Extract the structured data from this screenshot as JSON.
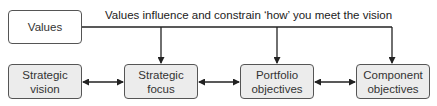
{
  "diagram": {
    "values_box": {
      "label": "Values"
    },
    "caption": "Values influence and constrain ‘how’ you meet the vision",
    "steps": [
      {
        "label": "Strategic vision",
        "line1": "Strategic",
        "line2": "vision"
      },
      {
        "label": "Strategic focus",
        "line1": "Strategic",
        "line2": "focus"
      },
      {
        "label": "Portfolio objectives",
        "line1": "Portfolio",
        "line2": "objectives"
      },
      {
        "label": "Component objectives",
        "line1": "Component",
        "line2": "objectives"
      }
    ],
    "connections": [
      {
        "from": "Strategic vision",
        "to": "Strategic focus",
        "type": "bidirectional"
      },
      {
        "from": "Strategic focus",
        "to": "Portfolio objectives",
        "type": "bidirectional"
      },
      {
        "from": "Portfolio objectives",
        "to": "Component objectives",
        "type": "bidirectional"
      },
      {
        "from": "Values",
        "to": "Strategic focus",
        "type": "directed"
      },
      {
        "from": "Values",
        "to": "Portfolio objectives",
        "type": "directed"
      },
      {
        "from": "Values",
        "to": "Component objectives",
        "type": "directed"
      }
    ],
    "colors": {
      "box_fill": "#ececec",
      "stroke": "#333333"
    }
  }
}
